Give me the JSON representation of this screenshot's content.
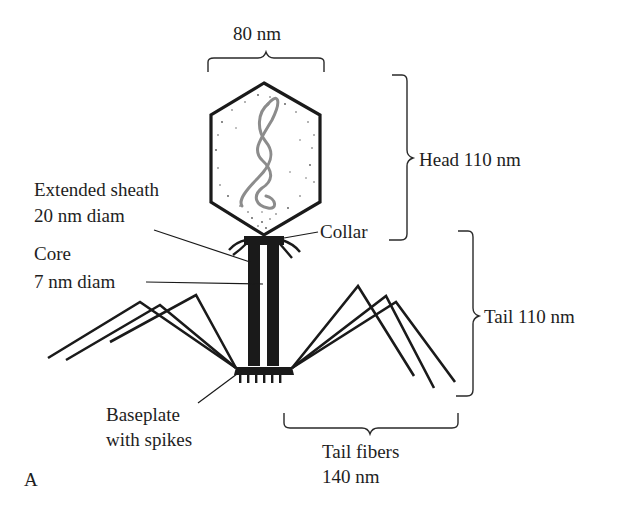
{
  "figure": {
    "panel_letter": "A",
    "colors": {
      "ink": "#1a1a1a",
      "dna": "#8c8c8c",
      "background": "#ffffff"
    }
  },
  "labels": {
    "head_width": "80 nm",
    "head_length": "Head 110 nm",
    "sheath_line1": "Extended sheath",
    "sheath_line2": "20 nm diam",
    "core_line1": "Core",
    "core_line2": "7 nm diam",
    "collar": "Collar",
    "tail_length": "Tail 110 nm",
    "baseplate_line1": "Baseplate",
    "baseplate_line2": "with spikes",
    "fibers_line1": "Tail fibers",
    "fibers_line2": "140 nm"
  }
}
